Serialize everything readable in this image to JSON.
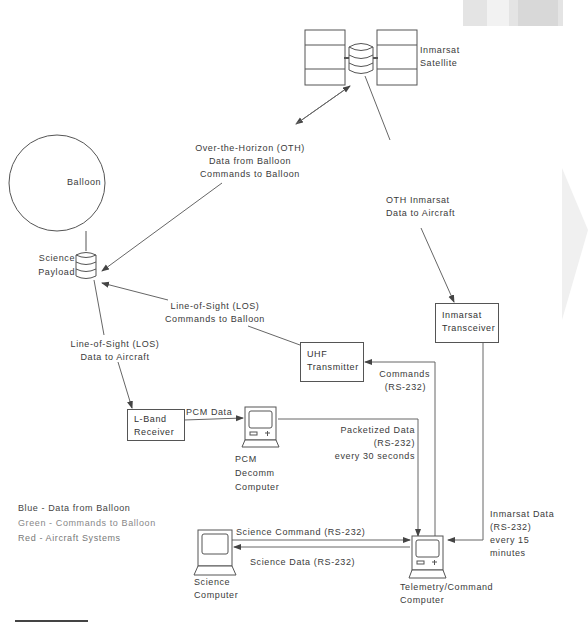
{
  "diagram": {
    "nodes": {
      "satellite": {
        "line1": "Inmarsat",
        "line2": "Satellite"
      },
      "balloon": {
        "label": "Balloon"
      },
      "payload": {
        "line1": "Science",
        "line2": "Payload"
      },
      "transceiver": {
        "line1": "Inmarsat",
        "line2": "Transceiver"
      },
      "uhf": {
        "line1": "UHF",
        "line2": "Transmitter"
      },
      "lband": {
        "line1": "L-Band",
        "line2": "Receiver"
      },
      "pcm_computer": {
        "line1": "PCM",
        "line2": "Decomm",
        "line3": "Computer"
      },
      "science_computer": {
        "line1": "Science",
        "line2": "Computer"
      },
      "telemetry_computer": {
        "line1": "Telemetry/Command",
        "line2": "Computer"
      }
    },
    "links": {
      "oth": {
        "line1": "Over-the-Horizon (OTH)",
        "line2": "Data from Balloon",
        "line3": "Commands to Balloon"
      },
      "oth_inmarsat": {
        "line1": "OTH Inmarsat",
        "line2": "Data to Aircraft"
      },
      "los_commands": {
        "line1": "Line-of-Sight (LOS)",
        "line2": "Commands to Balloon"
      },
      "los_data": {
        "line1": "Line-of-Sight (LOS)",
        "line2": "Data to Aircraft"
      },
      "pcm_data": {
        "label": "PCM Data"
      },
      "commands": {
        "line1": "Commands",
        "line2": "(RS-232)"
      },
      "packetized": {
        "line1": "Packetized Data",
        "line2": "(RS-232)",
        "line3": "every 30 seconds"
      },
      "inmarsat_data": {
        "line1": "Inmarsat Data",
        "line2": "(RS-232)",
        "line3": "every 15",
        "line4": "minutes"
      },
      "science_command": {
        "label": "Science Command (RS-232)"
      },
      "science_data": {
        "label": "Science Data (RS-232)"
      }
    },
    "legend": {
      "blue": "Blue - Data from Balloon",
      "green": "Green - Commands to Balloon",
      "red": "Red - Aircraft Systems"
    }
  }
}
